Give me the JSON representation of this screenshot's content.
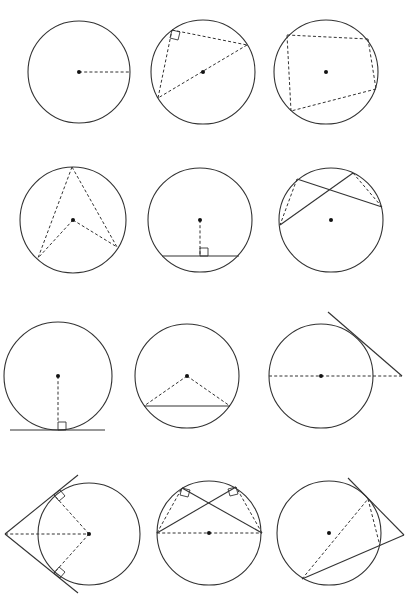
{
  "colors": {
    "stroke": "#333333",
    "center_dot": "#111111",
    "background": "#ffffff"
  },
  "diagrams": [
    {
      "id": "radius",
      "label": "Circle with radius",
      "circle": {
        "cx": 79,
        "cy": 72,
        "r": 51
      },
      "dashed": [
        [
          79,
          72,
          130,
          72
        ]
      ],
      "solid": [],
      "right_angles": []
    },
    {
      "id": "angle-in-semicircle",
      "label": "Angle in a semicircle is 90 degrees",
      "circle": {
        "cx": 203,
        "cy": 72,
        "r": 52
      },
      "dashed": [
        [
          172,
          30,
          247,
          45
        ],
        [
          247,
          45,
          158,
          98
        ],
        [
          158,
          98,
          172,
          30
        ]
      ],
      "solid": [],
      "right_angles": [
        [
          172,
          30,
          180,
          32,
          178,
          40,
          170,
          38
        ]
      ]
    },
    {
      "id": "cyclic-quadrilateral",
      "label": "Opposite angles of cyclic quadrilateral",
      "circle": {
        "cx": 326,
        "cy": 72,
        "r": 52
      },
      "dashed": [
        [
          287,
          35,
          368,
          39
        ],
        [
          368,
          39,
          376,
          89
        ],
        [
          376,
          89,
          291,
          111
        ],
        [
          291,
          111,
          287,
          35
        ]
      ],
      "solid": [],
      "right_angles": []
    },
    {
      "id": "angle-at-centre",
      "label": "Angle at centre is twice angle at circumference",
      "circle": {
        "cx": 73,
        "cy": 220,
        "r": 53
      },
      "dashed": [
        [
          72,
          167,
          38,
          258
        ],
        [
          72,
          167,
          117,
          247
        ],
        [
          73,
          220,
          38,
          258
        ],
        [
          73,
          220,
          117,
          247
        ]
      ],
      "solid": [],
      "right_angles": []
    },
    {
      "id": "perpendicular-bisector-chord",
      "label": "Perpendicular from centre bisects chord",
      "circle": {
        "cx": 200,
        "cy": 220,
        "r": 52
      },
      "dashed": [
        [
          200,
          220,
          200,
          256
        ]
      ],
      "solid": [
        [
          162,
          256,
          239,
          256
        ]
      ],
      "right_angles": [
        [
          200,
          248,
          208,
          248,
          208,
          256,
          200,
          256
        ]
      ]
    },
    {
      "id": "angles-same-segment",
      "label": "Angles in the same segment are equal",
      "circle": {
        "cx": 331,
        "cy": 220,
        "r": 52
      },
      "dashed": [
        [
          297,
          179,
          280,
          225
        ],
        [
          353,
          173,
          382,
          207
        ]
      ],
      "solid": [
        [
          297,
          179,
          382,
          207
        ],
        [
          280,
          225,
          353,
          173
        ]
      ],
      "right_angles": []
    },
    {
      "id": "tangent-radius",
      "label": "Tangent perpendicular to radius",
      "circle": {
        "cx": 58,
        "cy": 376,
        "r": 54
      },
      "dashed": [
        [
          58,
          376,
          58,
          422
        ]
      ],
      "solid": [
        [
          10,
          430,
          105,
          430
        ]
      ],
      "right_angles": [
        [
          58,
          422,
          66,
          422,
          66,
          430,
          58,
          430
        ]
      ]
    },
    {
      "id": "isosceles-triangle-radii",
      "label": "Isosceles triangle formed by two radii",
      "circle": {
        "cx": 187,
        "cy": 376,
        "r": 52
      },
      "dashed": [
        [
          187,
          376,
          144,
          406
        ],
        [
          187,
          376,
          230,
          406
        ]
      ],
      "solid": [
        [
          144,
          406,
          230,
          406
        ]
      ],
      "right_angles": []
    },
    {
      "id": "tangent-from-external-point",
      "label": "Tangent and line through centre",
      "circle": {
        "cx": 321,
        "cy": 376,
        "r": 52
      },
      "dashed": [
        [
          269,
          376,
          402,
          376
        ]
      ],
      "solid": [
        [
          328,
          312,
          402,
          376
        ]
      ],
      "right_angles": []
    },
    {
      "id": "two-tangents",
      "label": "Two tangents from an external point are equal",
      "circle": {
        "cx": 89,
        "cy": 534,
        "r": 51
      },
      "dashed": [
        [
          5,
          534,
          89,
          534
        ],
        [
          89,
          534,
          54,
          495
        ],
        [
          89,
          534,
          54,
          573
        ]
      ],
      "solid": [
        [
          5,
          534,
          78,
          475
        ],
        [
          5,
          534,
          78,
          593
        ]
      ],
      "right_angles": [
        [
          54,
          495,
          60,
          490,
          65,
          496,
          59,
          501
        ],
        [
          54,
          573,
          59,
          567,
          65,
          572,
          60,
          578
        ]
      ]
    },
    {
      "id": "semicircle-angles",
      "label": "Angles in semicircle from diameter",
      "circle": {
        "cx": 209,
        "cy": 533,
        "r": 52
      },
      "dashed": [
        [
          157,
          533,
          262,
          533
        ],
        [
          157,
          533,
          182,
          488
        ],
        [
          262,
          533,
          236,
          487
        ]
      ],
      "solid": [
        [
          157,
          533,
          236,
          487
        ],
        [
          262,
          533,
          182,
          488
        ]
      ],
      "right_angles": [
        [
          182,
          488,
          190,
          490,
          188,
          497,
          180,
          495
        ],
        [
          236,
          487,
          228,
          489,
          230,
          496,
          238,
          494
        ]
      ]
    },
    {
      "id": "alternate-segment",
      "label": "Alternate segment theorem",
      "circle": {
        "cx": 329,
        "cy": 533,
        "r": 52
      },
      "dashed": [
        [
          302,
          579,
          368,
          499
        ],
        [
          368,
          499,
          380,
          546
        ]
      ],
      "solid": [
        [
          348,
          478,
          404,
          535
        ],
        [
          404,
          535,
          302,
          579
        ]
      ],
      "right_angles": []
    }
  ]
}
